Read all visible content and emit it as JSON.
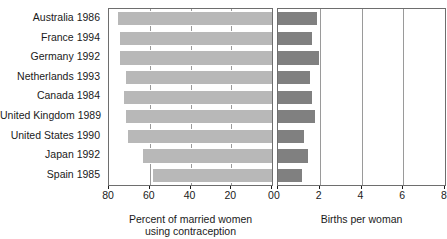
{
  "chart_data": {
    "type": "bar",
    "title": "",
    "layout": "paired horizontal bar (back-to-back panels)",
    "categories": [
      "Australia 1986",
      "France 1994",
      "Germany 1992",
      "Netherlands 1993",
      "Canada 1984",
      "United Kingdom 1989",
      "United States 1990",
      "Japan 1992",
      "Spain 1985"
    ],
    "series": [
      {
        "name": "Percent of married women using contraception",
        "panel": "left",
        "direction": "right-to-left",
        "values": [
          76,
          75,
          75,
          72,
          73,
          72,
          71,
          64,
          59
        ],
        "axis": {
          "label": "Percent of married women using contraception",
          "ticks": [
            80,
            60,
            40,
            20,
            0
          ],
          "range": [
            80,
            0
          ],
          "reversed": true,
          "grid": true
        },
        "color": "#b8b8b8"
      },
      {
        "name": "Births per woman",
        "panel": "right",
        "direction": "left-to-right",
        "values": [
          1.9,
          1.7,
          2.0,
          1.6,
          1.7,
          1.8,
          1.3,
          1.5,
          1.2
        ],
        "axis": {
          "label": "Births per woman",
          "ticks": [
            0,
            2,
            4,
            6,
            8
          ],
          "range": [
            0,
            8
          ],
          "reversed": false,
          "grid": true
        },
        "color": "#808080"
      }
    ],
    "xlabel_left_line1": "Percent of married women",
    "xlabel_left_line2": "using contraception",
    "xlabel_right": "Births per woman",
    "ylabel": ""
  },
  "left_axis": {
    "title_line1": "Percent of married women",
    "title_line2": "using contraception",
    "tick_labels": [
      "80",
      "60",
      "40",
      "20",
      "0"
    ]
  },
  "right_axis": {
    "title": "Births per woman",
    "tick_labels": [
      "0",
      "2",
      "4",
      "6",
      "8"
    ]
  },
  "colors": {
    "left_bar": "#b8b8b8",
    "right_bar": "#808080",
    "grid": "#9a9a9a",
    "frame": "#6e6e6e",
    "text": "#1a1a1a",
    "background": "#ffffff"
  }
}
